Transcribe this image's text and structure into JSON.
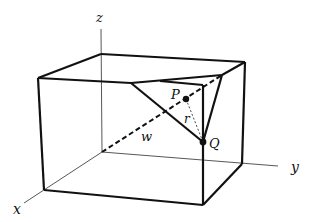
{
  "diagram": {
    "type": "3d-box-geometry",
    "axes": {
      "x_label": "x",
      "y_label": "y",
      "z_label": "z"
    },
    "points": {
      "P_label": "P",
      "Q_label": "Q"
    },
    "segments": {
      "w_label": "w",
      "r_label": "r"
    },
    "colors": {
      "stroke": "#111111",
      "axis": "#444444",
      "background": "#ffffff"
    }
  }
}
